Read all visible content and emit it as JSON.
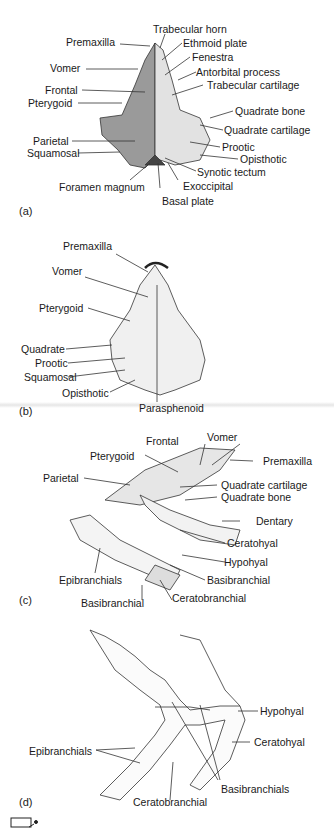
{
  "figure": {
    "panels": [
      {
        "id": "a",
        "label": "(a)",
        "labels_left": [
          "Premaxilla",
          "Vomer",
          "Frontal",
          "Pterygoid",
          "Parietal",
          "Squamosal",
          "Foramen magnum"
        ],
        "labels_right": [
          "Trabecular horn",
          "Ethmoid plate",
          "Fenestra",
          "Antorbital process",
          "Trabecular cartilage",
          "Quadrate bone",
          "Quadrate cartilage",
          "Prootic",
          "Opisthotic",
          "Synotic tectum",
          "Exoccipital",
          "Basal plate"
        ]
      },
      {
        "id": "b",
        "label": "(b)",
        "labels_left": [
          "Premaxilla",
          "Vomer",
          "Pterygoid",
          "Quadrate",
          "Prootic",
          "Squamosal",
          "Opisthotic"
        ],
        "labels_bottom": [
          "Parasphenoid"
        ]
      },
      {
        "id": "c",
        "label": "(c)",
        "labels_top": [
          "Frontal",
          "Vomer",
          "Pterygoid",
          "Parietal"
        ],
        "labels_right": [
          "Premaxilla",
          "Quadrate cartilage",
          "Quadrate bone",
          "Dentary",
          "Ceratohyal",
          "Hypohyal",
          "Basibranchial",
          "Ceratobranchial"
        ],
        "labels_left": [
          "Epibranchials",
          "Basibranchial"
        ]
      },
      {
        "id": "d",
        "label": "(d)",
        "labels": [
          "Hypohyal",
          "Ceratohyal",
          "Epibranchials",
          "Basibranchials",
          "Ceratobranchial"
        ]
      }
    ]
  }
}
